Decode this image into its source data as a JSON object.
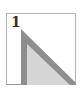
{
  "figure": {
    "label": "1",
    "shape": "right-triangle",
    "colors": {
      "frame_border": "#b4b4b4",
      "triangle_outline": "#8e8e8e",
      "triangle_fill": "#d6d6d6",
      "label_text": "#333333"
    }
  }
}
